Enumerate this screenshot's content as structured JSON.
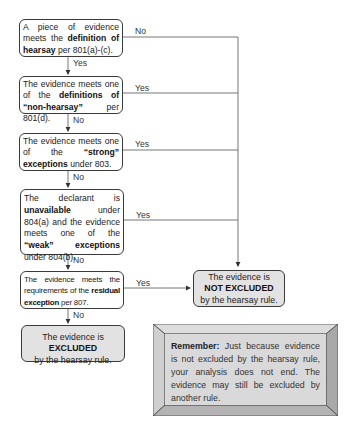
{
  "nodes": [
    {
      "id": "q1",
      "parts": [
        {
          "t": "A piece of evidence meets the "
        },
        {
          "t": "definition of hearsay",
          "b": true
        },
        {
          "t": " per 801(a)-(c)."
        }
      ]
    },
    {
      "id": "q2",
      "parts": [
        {
          "t": "The evidence meets one of the "
        },
        {
          "t": "definitions of “non-hearsay”",
          "b": true
        },
        {
          "t": " per 801(d)."
        }
      ]
    },
    {
      "id": "q3",
      "parts": [
        {
          "t": "The evidence meets one of the "
        },
        {
          "t": "“strong” exceptions",
          "b": true
        },
        {
          "t": " under 803."
        }
      ]
    },
    {
      "id": "q4",
      "parts": [
        {
          "t": "The declarant is "
        },
        {
          "t": "unavailable",
          "b": true
        },
        {
          "t": " under 804(a) and the evidence meets one of the "
        },
        {
          "t": "“weak” exceptions",
          "b": true
        },
        {
          "t": " under 804(b)."
        }
      ]
    },
    {
      "id": "q5",
      "parts": [
        {
          "t": "The evidence meets the requirements of the "
        },
        {
          "t": "residual exception",
          "b": true
        },
        {
          "t": " per 807."
        }
      ]
    }
  ],
  "outcomes": {
    "excluded": {
      "pre": "The evidence is ",
      "bold": "EXCLUDED",
      "post": "by the hearsay rule."
    },
    "not_excluded": {
      "pre": "The evidence is",
      "bold": "NOT EXCLUDED",
      "post": "by the hearsay rule."
    }
  },
  "edge_labels": {
    "q1_right": "No",
    "q1_down": "Yes",
    "q2_right": "Yes",
    "q2_down": "No",
    "q3_right": "Yes",
    "q3_down": "No",
    "q4_right": "Yes",
    "q4_down": "No",
    "q5_right": "Yes",
    "q5_down": "No"
  },
  "remember": {
    "bold": "Remember:",
    "text": " Just because evidence is not excluded by the hearsay rule, your analysis does not end. The evidence may still be excluded by another rule."
  },
  "colors": {
    "line": "#555555",
    "outcome_fill": "#e2e2e2",
    "bevel_top": "#dcdcdc",
    "bevel_left": "#cfcfcf",
    "bevel_right": "#a9a9a9",
    "bevel_bottom": "#b3b3b3",
    "bevel_face": "#d9d9d9"
  }
}
